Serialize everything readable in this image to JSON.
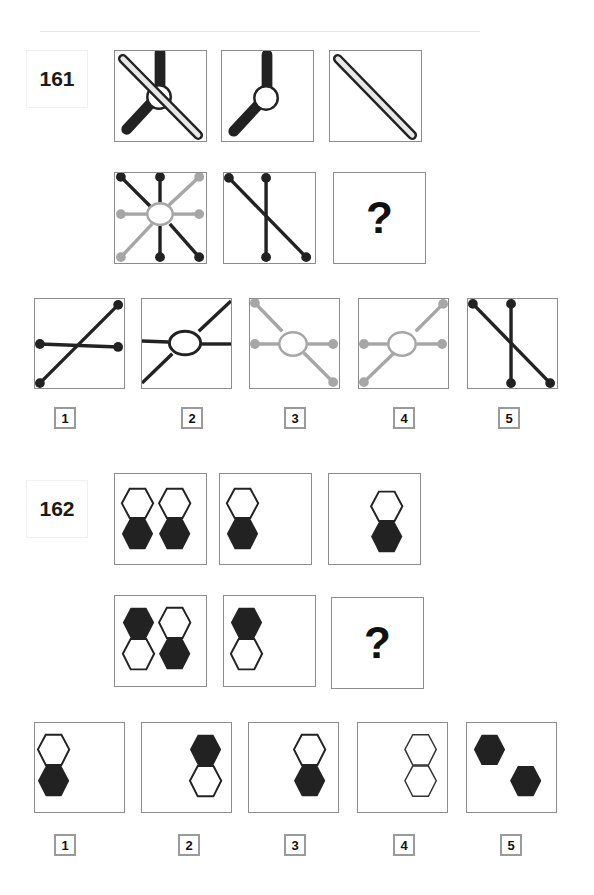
{
  "puzzles": [
    {
      "number": "161",
      "question_mark": "?",
      "options": [
        {
          "label": "1"
        },
        {
          "label": "2"
        },
        {
          "label": "3"
        },
        {
          "label": "4"
        },
        {
          "label": "5"
        }
      ]
    },
    {
      "number": "162",
      "question_mark": "?",
      "options": [
        {
          "label": "1"
        },
        {
          "label": "2"
        },
        {
          "label": "3"
        },
        {
          "label": "4"
        },
        {
          "label": "5"
        }
      ]
    }
  ],
  "colors": {
    "dark": "#222222",
    "gray": "#a6a6a6",
    "bar_fill": "#e8e8e8",
    "border": "#8c8c8c"
  }
}
